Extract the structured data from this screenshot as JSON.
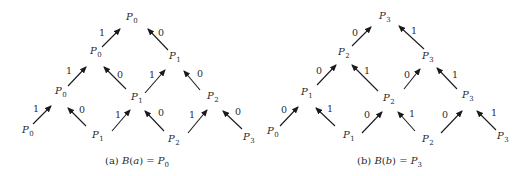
{
  "diagrams": [
    {
      "id": "a",
      "caption": {
        "prefix": "(a) ",
        "func": "B",
        "arg": "a",
        "eq": " = ",
        "result_base": "P",
        "result_sub": "0"
      },
      "nodes": [
        {
          "base": "P",
          "sub": "0",
          "x": 126,
          "y": 20
        },
        {
          "base": "P",
          "sub": "0",
          "x": 90,
          "y": 54
        },
        {
          "base": "P",
          "sub": "1",
          "x": 169,
          "y": 59
        },
        {
          "base": "P",
          "sub": "0",
          "x": 55,
          "y": 94
        },
        {
          "base": "P",
          "sub": "1",
          "x": 131,
          "y": 100
        },
        {
          "base": "P",
          "sub": "2",
          "x": 207,
          "y": 99
        },
        {
          "base": "P",
          "sub": "0",
          "x": 22,
          "y": 133
        },
        {
          "base": "P",
          "sub": "1",
          "x": 92,
          "y": 138
        },
        {
          "base": "P",
          "sub": "2",
          "x": 168,
          "y": 142
        },
        {
          "base": "P",
          "sub": "3",
          "x": 243,
          "y": 140
        }
      ],
      "edges": [
        {
          "x1": 102,
          "y1": 47,
          "x2": 120,
          "y2": 29,
          "label": "1",
          "lx": 99,
          "ly": 36
        },
        {
          "x1": 168,
          "y1": 50,
          "x2": 148,
          "y2": 29,
          "label": "0",
          "lx": 158,
          "ly": 36
        },
        {
          "x1": 68,
          "y1": 86,
          "x2": 86,
          "y2": 67,
          "label": "1",
          "lx": 66,
          "ly": 74
        },
        {
          "x1": 126,
          "y1": 89,
          "x2": 104,
          "y2": 67,
          "label": "0",
          "lx": 117,
          "ly": 78
        },
        {
          "x1": 145,
          "y1": 93,
          "x2": 165,
          "y2": 70,
          "label": "1",
          "lx": 149,
          "ly": 78
        },
        {
          "x1": 200,
          "y1": 90,
          "x2": 184,
          "y2": 71,
          "label": "0",
          "lx": 197,
          "ly": 77
        },
        {
          "x1": 33,
          "y1": 124,
          "x2": 51,
          "y2": 106,
          "label": "1",
          "lx": 33,
          "ly": 112
        },
        {
          "x1": 86,
          "y1": 126,
          "x2": 68,
          "y2": 108,
          "label": "0",
          "lx": 79,
          "ly": 113
        },
        {
          "x1": 112,
          "y1": 131,
          "x2": 130,
          "y2": 110,
          "label": "1",
          "lx": 115,
          "ly": 118
        },
        {
          "x1": 164,
          "y1": 131,
          "x2": 145,
          "y2": 111,
          "label": "0",
          "lx": 158,
          "ly": 116
        },
        {
          "x1": 188,
          "y1": 133,
          "x2": 207,
          "y2": 110,
          "label": "1",
          "lx": 189,
          "ly": 118
        },
        {
          "x1": 242,
          "y1": 129,
          "x2": 223,
          "y2": 111,
          "label": "0",
          "lx": 235,
          "ly": 115
        }
      ],
      "caption_x": 105,
      "caption_y": 164
    },
    {
      "id": "b",
      "caption": {
        "prefix": "(b) ",
        "func": "B",
        "arg": "b",
        "eq": " = ",
        "result_base": "P",
        "result_sub": "3"
      },
      "nodes": [
        {
          "base": "P",
          "sub": "3",
          "x": 379,
          "y": 19
        },
        {
          "base": "P",
          "sub": "2",
          "x": 338,
          "y": 55
        },
        {
          "base": "P",
          "sub": "3",
          "x": 422,
          "y": 59
        },
        {
          "base": "P",
          "sub": "1",
          "x": 301,
          "y": 95
        },
        {
          "base": "P",
          "sub": "2",
          "x": 383,
          "y": 101
        },
        {
          "base": "P",
          "sub": "3",
          "x": 462,
          "y": 98
        },
        {
          "base": "P",
          "sub": "0",
          "x": 267,
          "y": 134
        },
        {
          "base": "P",
          "sub": "1",
          "x": 343,
          "y": 138
        },
        {
          "base": "P",
          "sub": "2",
          "x": 422,
          "y": 142
        },
        {
          "base": "P",
          "sub": "3",
          "x": 497,
          "y": 139
        }
      ],
      "edges": [
        {
          "x1": 352,
          "y1": 46,
          "x2": 371,
          "y2": 27,
          "label": "0",
          "lx": 352,
          "ly": 36
        },
        {
          "x1": 424,
          "y1": 49,
          "x2": 399,
          "y2": 26,
          "label": "1",
          "lx": 411,
          "ly": 34
        },
        {
          "x1": 317,
          "y1": 85,
          "x2": 336,
          "y2": 65,
          "label": "0",
          "lx": 316,
          "ly": 74
        },
        {
          "x1": 378,
          "y1": 91,
          "x2": 352,
          "y2": 65,
          "label": "1",
          "lx": 364,
          "ly": 74
        },
        {
          "x1": 404,
          "y1": 89,
          "x2": 420,
          "y2": 69,
          "label": "0",
          "lx": 404,
          "ly": 78
        },
        {
          "x1": 457,
          "y1": 89,
          "x2": 437,
          "y2": 68,
          "label": "1",
          "lx": 452,
          "ly": 78
        },
        {
          "x1": 280,
          "y1": 126,
          "x2": 298,
          "y2": 107,
          "label": "0",
          "lx": 281,
          "ly": 113
        },
        {
          "x1": 335,
          "y1": 126,
          "x2": 316,
          "y2": 108,
          "label": "1",
          "lx": 327,
          "ly": 112
        },
        {
          "x1": 362,
          "y1": 133,
          "x2": 382,
          "y2": 112,
          "label": "0",
          "lx": 364,
          "ly": 118
        },
        {
          "x1": 415,
          "y1": 131,
          "x2": 398,
          "y2": 112,
          "label": "1",
          "lx": 409,
          "ly": 117
        },
        {
          "x1": 441,
          "y1": 133,
          "x2": 462,
          "y2": 111,
          "label": "0",
          "lx": 442,
          "ly": 118
        },
        {
          "x1": 496,
          "y1": 130,
          "x2": 477,
          "y2": 111,
          "label": "1",
          "lx": 491,
          "ly": 116
        }
      ],
      "caption_x": 357,
      "caption_y": 164
    }
  ]
}
